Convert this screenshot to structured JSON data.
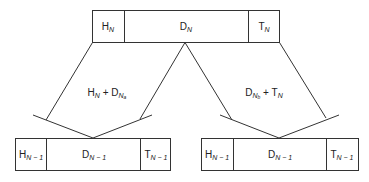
{
  "diagram": {
    "top_box": {
      "header": {
        "base": "H",
        "sub": "N"
      },
      "data": {
        "base": "D",
        "sub": "N"
      },
      "trailer": {
        "base": "T",
        "sub": "N"
      }
    },
    "left_branch_label": {
      "part1": {
        "base": "H",
        "sub": "N"
      },
      "plus": "+",
      "part2": {
        "base": "D",
        "sub": "N",
        "subsub": "a"
      }
    },
    "right_branch_label": {
      "part1": {
        "base": "D",
        "sub": "N",
        "subsub": "b"
      },
      "plus": "+",
      "part2": {
        "base": "T",
        "sub": "N"
      }
    },
    "bottom_left_box": {
      "header": {
        "base": "H",
        "sub": "N − 1"
      },
      "data": {
        "base": "D",
        "sub": "N − 1"
      },
      "trailer": {
        "base": "T",
        "sub": "N − 1"
      }
    },
    "bottom_right_box": {
      "header": {
        "base": "H",
        "sub": "N − 1"
      },
      "data": {
        "base": "D",
        "sub": "N − 1"
      },
      "trailer": {
        "base": "T",
        "sub": "N − 1"
      }
    }
  }
}
